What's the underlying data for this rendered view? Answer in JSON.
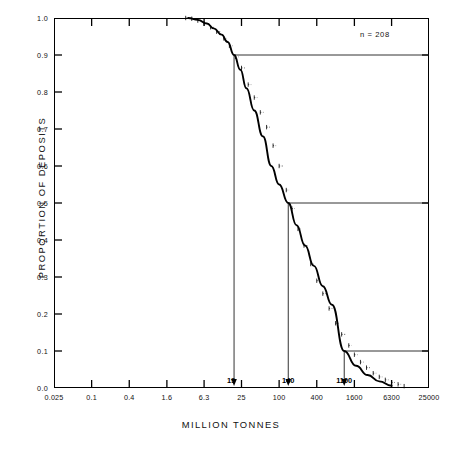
{
  "chart_data": {
    "type": "line",
    "title": "",
    "xlabel": "MILLION TONNES",
    "ylabel": "PROPORTION OF DEPOSITS",
    "annotation": "n = 208",
    "x_scale": "log",
    "xlim": [
      0.025,
      25000
    ],
    "ylim": [
      0.0,
      1.0
    ],
    "grid": false,
    "legend": "none",
    "x_tick_labels": [
      "0.025",
      "0.1",
      "0.4",
      "1.6",
      "6.3",
      "25",
      "100",
      "400",
      "1600",
      "6300",
      "25000"
    ],
    "x_tick_values": [
      0.025,
      0.1,
      0.4,
      1.6,
      6.3,
      25,
      100,
      400,
      1600,
      6300,
      25000
    ],
    "y_tick_labels": [
      "0.0",
      "0.1",
      "0.2",
      "0.3",
      "0.4",
      "0.5",
      "0.6",
      "0.7",
      "0.8",
      "0.9",
      "1.0"
    ],
    "y_tick_values": [
      0.0,
      0.1,
      0.2,
      0.3,
      0.4,
      0.5,
      0.6,
      0.7,
      0.8,
      0.9,
      1.0
    ],
    "series": [
      {
        "name": "fitted cumulative lognormal curve",
        "style": "smooth-solid",
        "x": [
          3.5,
          5.0,
          7.0,
          9.0,
          12.0,
          15.0,
          19.0,
          24.0,
          30.0,
          40.0,
          55.0,
          75.0,
          100.0,
          140.0,
          190.0,
          260.0,
          360.0,
          500.0,
          700.0,
          1100.0,
          1700.0,
          2600.0,
          4000.0,
          6300.0
        ],
        "y": [
          1.0,
          0.995,
          0.985,
          0.972,
          0.955,
          0.935,
          0.9,
          0.86,
          0.81,
          0.75,
          0.68,
          0.6,
          0.55,
          0.5,
          0.44,
          0.385,
          0.33,
          0.275,
          0.225,
          0.1,
          0.06,
          0.035,
          0.018,
          0.006
        ]
      },
      {
        "name": "empirical step data points",
        "style": "stepped-dots",
        "x": [
          3.2,
          4.0,
          5.0,
          6.3,
          8.0,
          10.0,
          13.0,
          16.0,
          20.0,
          25.0,
          32.0,
          40.0,
          50.0,
          63.0,
          80.0,
          100.0,
          130.0,
          160.0,
          200.0,
          250.0,
          320.0,
          400.0,
          500.0,
          630.0,
          800.0,
          1000.0,
          1300.0,
          1600.0,
          2000.0,
          2500.0,
          3200.0,
          4000.0,
          5000.0,
          6300.0,
          8000.0,
          10000.0
        ],
        "y": [
          1.0,
          0.998,
          0.993,
          0.985,
          0.975,
          0.963,
          0.945,
          0.925,
          0.895,
          0.865,
          0.82,
          0.785,
          0.745,
          0.705,
          0.655,
          0.6,
          0.535,
          0.485,
          0.43,
          0.385,
          0.335,
          0.29,
          0.255,
          0.215,
          0.175,
          0.145,
          0.115,
          0.09,
          0.07,
          0.055,
          0.04,
          0.03,
          0.022,
          0.015,
          0.01,
          0.005
        ]
      }
    ],
    "percentile_markers": [
      {
        "name": "90th percentile",
        "proportion": 0.9,
        "x_value": 19,
        "label": "19"
      },
      {
        "name": "50th percentile",
        "proportion": 0.5,
        "x_value": 140,
        "label": "140"
      },
      {
        "name": "10th percentile",
        "proportion": 0.1,
        "x_value": 1100,
        "label": "1100"
      }
    ]
  },
  "axes": {
    "y_title": "PROPORTION OF DEPOSITS",
    "x_title": "MILLION TONNES",
    "annotation": "n = 208"
  },
  "y_labels": [
    "1.0",
    "0.9",
    "0.8",
    "0.7",
    "0.6",
    "0.5",
    "0.4",
    "0.3",
    "0.2",
    "0.1",
    "0.0"
  ],
  "x_labels": [
    "0.025",
    "0.1",
    "0.4",
    "1.6",
    "6.3",
    "25",
    "100",
    "400",
    "1600",
    "6300",
    "25000"
  ],
  "drop_labels": [
    "19",
    "140",
    "1100"
  ],
  "colors": {
    "axis": "#000000",
    "curve": "#000000",
    "reference_line": "#333333",
    "background": "#ffffff"
  }
}
